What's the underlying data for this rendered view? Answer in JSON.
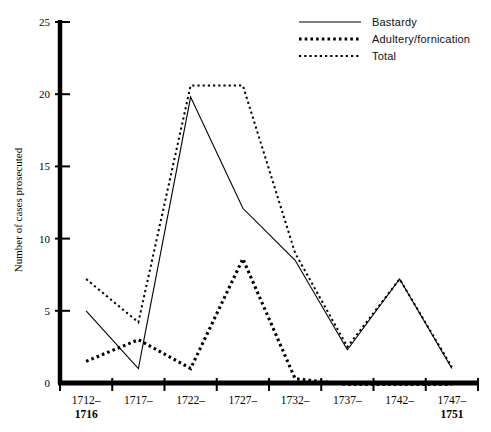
{
  "chart_data": {
    "type": "line",
    "title": "",
    "subtitle": "",
    "xlabel": "",
    "ylabel": "Number of cases prosecuted",
    "categories": [
      "1712–1716",
      "1717–",
      "1722–",
      "1727–",
      "1732–",
      "1737–",
      "1742–",
      "1747–1751"
    ],
    "category_lines": [
      [
        "1712–",
        "1716"
      ],
      [
        "1717–",
        ""
      ],
      [
        "1722–",
        ""
      ],
      [
        "1727–",
        ""
      ],
      [
        "1732–",
        ""
      ],
      [
        "1737–",
        ""
      ],
      [
        "1742–",
        ""
      ],
      [
        "1747–",
        "1751"
      ]
    ],
    "ylim": [
      0,
      25
    ],
    "yticks": [
      0,
      5,
      10,
      15,
      20,
      25
    ],
    "ytick_labels": [
      "0",
      "5",
      "10",
      "15",
      "20",
      "25"
    ],
    "xlim_note": "categories plotted at equal spacing; axis ticks drawn at category boundaries",
    "grid": false,
    "legend_position": "top-right",
    "series": [
      {
        "name": "Bastardy",
        "style": "solid",
        "values": [
          5.0,
          1.0,
          19.8,
          12.1,
          8.5,
          2.3,
          7.2,
          1.0
        ]
      },
      {
        "name": "Adultery/fornication",
        "style": "dotted-thick",
        "values": [
          1.5,
          3.0,
          1.0,
          8.6,
          0.3,
          -0.1,
          -0.1,
          -0.1
        ]
      },
      {
        "name": "Total",
        "style": "dotted-thin",
        "values": [
          7.2,
          4.2,
          20.6,
          20.6,
          9.0,
          2.5,
          7.2,
          1.1
        ]
      }
    ]
  },
  "legend": {
    "entries": [
      {
        "label": "Bastardy",
        "style": "solid"
      },
      {
        "label": "Adultery/fornication",
        "style": "dotted-thick"
      },
      {
        "label": "Total",
        "style": "dotted-thin"
      }
    ]
  },
  "axes": {
    "y_axis_title": "Number of cases prosecuted"
  }
}
